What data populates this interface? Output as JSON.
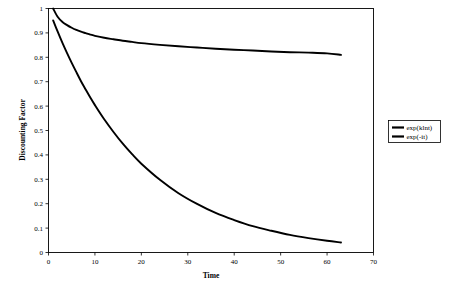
{
  "chart_data": {
    "type": "line",
    "title": "",
    "xlabel": "Time",
    "ylabel": "Discounting Factor",
    "xlim": [
      0,
      70
    ],
    "ylim": [
      0,
      1
    ],
    "grid": false,
    "legend_position": "right-outside",
    "xticks": [
      "0",
      "10",
      "20",
      "30",
      "40",
      "50",
      "60",
      "70"
    ],
    "xtick_values": [
      0,
      10,
      20,
      30,
      40,
      50,
      60,
      70
    ],
    "yticks": [
      "0",
      "0.1",
      "0.2",
      "0.3",
      "0.4",
      "0.5",
      "0.6",
      "0.7",
      "0.8",
      "0.9",
      "1"
    ],
    "ytick_values": [
      0,
      0.1,
      0.2,
      0.3,
      0.4,
      0.5,
      0.6,
      0.7,
      0.8,
      0.9,
      1.0
    ],
    "x": [
      1,
      2,
      3,
      4,
      5,
      6,
      7,
      8,
      9,
      10,
      12,
      14,
      16,
      18,
      20,
      24,
      28,
      32,
      36,
      40,
      44,
      48,
      52,
      56,
      60,
      63
    ],
    "series": [
      {
        "name": "exp(klnt)",
        "formula": "exp(k ln t)",
        "color": "#000000",
        "values": [
          1.0,
          0.965,
          0.945,
          0.932,
          0.921,
          0.912,
          0.905,
          0.899,
          0.893,
          0.888,
          0.88,
          0.874,
          0.868,
          0.863,
          0.858,
          0.851,
          0.845,
          0.84,
          0.835,
          0.831,
          0.828,
          0.824,
          0.821,
          0.819,
          0.816,
          0.81
        ]
      },
      {
        "name": "exp(-it)",
        "formula": "exp(-i t)",
        "color": "#000000",
        "values": [
          0.951,
          0.904,
          0.859,
          0.817,
          0.777,
          0.739,
          0.702,
          0.668,
          0.635,
          0.604,
          0.546,
          0.494,
          0.446,
          0.403,
          0.364,
          0.298,
          0.243,
          0.199,
          0.162,
          0.133,
          0.108,
          0.089,
          0.072,
          0.059,
          0.048,
          0.041
        ]
      }
    ],
    "legend_entries": [
      {
        "label": "exp(klnt)",
        "color": "#000000"
      },
      {
        "label": "exp(-it)",
        "color": "#000000"
      }
    ]
  }
}
